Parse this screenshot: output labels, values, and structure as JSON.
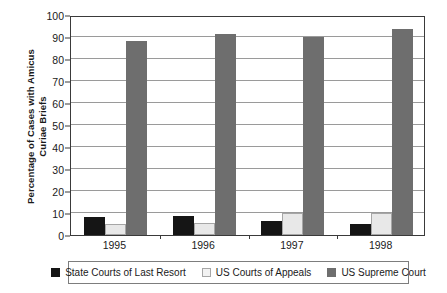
{
  "chart_data": {
    "type": "bar",
    "title": "",
    "subtitle": "",
    "xlabel": "",
    "ylabel": "Percentage of Cases with Amicus Curiae Briefs",
    "ylabel_line1": "Percentage of Cases with Amicus",
    "ylabel_line2": "Curiae Briefs",
    "categories": [
      "1995",
      "1996",
      "1997",
      "1998"
    ],
    "ylim": [
      0,
      100
    ],
    "yticks": [
      0,
      10,
      20,
      30,
      40,
      50,
      60,
      70,
      80,
      90,
      100
    ],
    "ytick_labels": [
      "0",
      "10",
      "20",
      "30",
      "40",
      "50",
      "60",
      "70",
      "80",
      "90",
      "100"
    ],
    "grid": true,
    "grid_axis": "y",
    "legend_position": "bottom",
    "series": [
      {
        "name": "State Courts of Last Resort",
        "color": "#151515",
        "values": [
          8.0,
          8.8,
          6.5,
          5.2
        ]
      },
      {
        "name": "US Courts of Appeals",
        "color": "#e8e8e8",
        "values": [
          5.0,
          5.5,
          10.0,
          10.0
        ]
      },
      {
        "name": "US Supreme Court",
        "color": "#6e6e6e",
        "values": [
          88.3,
          91.5,
          90.0,
          93.5
        ]
      }
    ]
  },
  "legend": {
    "items": [
      {
        "label": "State Courts of Last Resort",
        "swatch": "black-square-swatch"
      },
      {
        "label": "US Courts of Appeals",
        "swatch": "white-square-swatch"
      },
      {
        "label": "US Supreme Court",
        "swatch": "gray-square-swatch"
      }
    ]
  }
}
